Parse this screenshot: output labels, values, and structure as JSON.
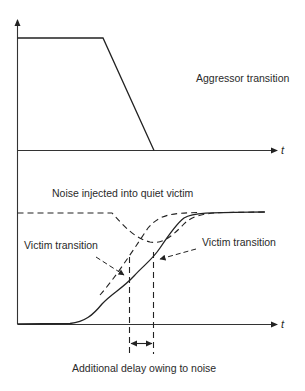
{
  "figure": {
    "type": "crosstalk-noise-timing-diagram",
    "top_panel": {
      "label": "Aggressor transition",
      "x_axis_label": "t",
      "waveform": "falling ramp from high to low"
    },
    "bottom_panel": {
      "x_axis_label": "t",
      "labels": {
        "noise": "Noise injected into quiet victim",
        "victim_left": "Victim transition",
        "victim_right": "Victim transition",
        "delay": "Additional delay owing to noise"
      },
      "waveforms": [
        {
          "name": "noise-glitch",
          "style": "dashed",
          "description": "dip below high level on quiet victim"
        },
        {
          "name": "victim-ideal",
          "style": "dashed",
          "description": "victim rising transition without noise"
        },
        {
          "name": "victim-noisy",
          "style": "solid",
          "description": "victim rising transition delayed by noise"
        }
      ]
    },
    "colors": {
      "background": "#ffffff",
      "ink": "#222222"
    }
  }
}
